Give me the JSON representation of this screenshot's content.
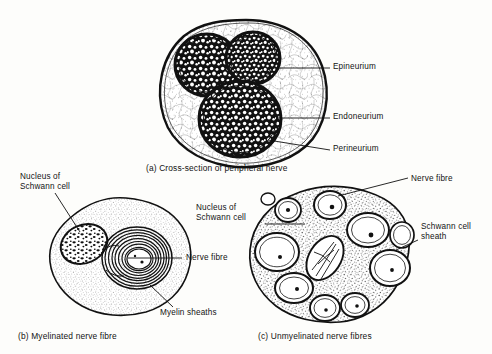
{
  "figure": {
    "background_color": "#fdfdfb",
    "ink_color": "#111111"
  },
  "panels": {
    "a": {
      "caption": "(a) Cross-section of peripheral nerve",
      "labels": {
        "epineurium": "Epineurium",
        "endoneurium": "Endoneurium",
        "perineurium": "Perineurium"
      }
    },
    "b": {
      "caption": "(b) Myelinated nerve fibre",
      "labels": {
        "nucleus_line1": "Nucleus of",
        "nucleus_line2": "Schwann cell",
        "nerve_fibre": "Nerve fibre",
        "myelin_sheaths": "Myelin sheaths"
      }
    },
    "c": {
      "caption": "(c) Unmyelinated nerve fibres",
      "labels": {
        "nucleus_line1": "Nucleus of",
        "nucleus_line2": "Schwann cell",
        "nerve_fibre": "Nerve fibre",
        "schwann_sheath_line1": "Schwann cell",
        "schwann_sheath_line2": "sheath"
      }
    }
  }
}
